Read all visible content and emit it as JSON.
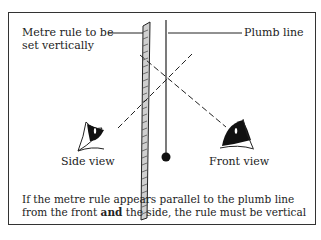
{
  "labels": {
    "ruler_line1": "Metre rule to be",
    "ruler_line2": "set vertically",
    "plumb": "Plumb line",
    "side_view": "Side view",
    "front_view": "Front view"
  },
  "caption": {
    "line1": "If the metre rule appears parallel to the plumb line",
    "line2_pre": "from the front ",
    "line2_bold": "and",
    "line2_post": " the side, the rule must be vertical"
  },
  "colors": {
    "stroke": "#222222",
    "ruler_fill": "#cfcfcf",
    "frame": "#333333"
  }
}
